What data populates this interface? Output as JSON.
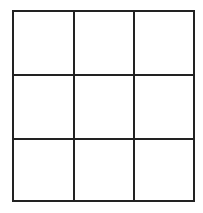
{
  "grid": {
    "rows": 3,
    "columns": 3,
    "line_color": "#222222",
    "background": "#ffffff",
    "cells": [
      [
        "",
        "",
        ""
      ],
      [
        "",
        "",
        ""
      ],
      [
        "",
        "",
        ""
      ]
    ]
  }
}
